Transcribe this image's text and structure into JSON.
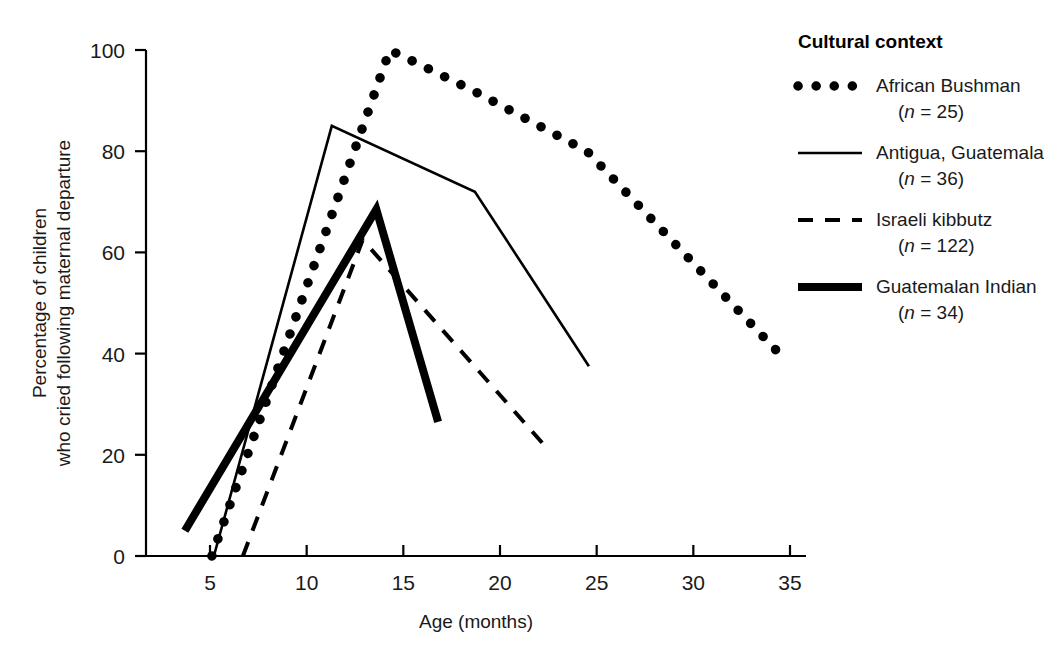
{
  "chart_data": {
    "type": "line",
    "title": "",
    "xlabel": "Age (months)",
    "ylabel": "Percentage of children who cried following maternal departure",
    "ylabel_line1": "Percentage of children",
    "ylabel_line2": "who cried following maternal departure",
    "xlim": [
      3,
      36
    ],
    "ylim": [
      0,
      100
    ],
    "xticks": [
      5,
      10,
      15,
      20,
      25,
      30,
      35
    ],
    "xtick_labels": [
      "5",
      "10",
      "15",
      "20",
      "25",
      "30",
      "35"
    ],
    "yticks": [
      0,
      20,
      40,
      60,
      80,
      100
    ],
    "ytick_labels": [
      "0",
      "20",
      "40",
      "60",
      "80",
      "100"
    ],
    "grid": false,
    "legend_position": "right",
    "legend_title": "Cultural context",
    "series": [
      {
        "name": "African Bushman",
        "n_label": "(n = 25)",
        "n": 25,
        "style": "dotted",
        "color": "#000000",
        "points": [
          {
            "x": 5.1,
            "y": 0
          },
          {
            "x": 14.3,
            "y": 100
          },
          {
            "x": 18.6,
            "y": 92
          },
          {
            "x": 24.5,
            "y": 80
          },
          {
            "x": 34.7,
            "y": 39
          }
        ]
      },
      {
        "name": "Antigua, Guatemala",
        "n_label": "(n = 36)",
        "n": 36,
        "style": "solid-thin",
        "color": "#000000",
        "points": [
          {
            "x": 5.2,
            "y": 0
          },
          {
            "x": 11.3,
            "y": 85
          },
          {
            "x": 18.7,
            "y": 72
          },
          {
            "x": 24.6,
            "y": 37.5
          }
        ]
      },
      {
        "name": "Israeli kibbutz",
        "n_label": "(n = 122)",
        "n": 122,
        "style": "dashed",
        "color": "#000000",
        "points": [
          {
            "x": 6.7,
            "y": 0
          },
          {
            "x": 12.9,
            "y": 62.5
          },
          {
            "x": 22.5,
            "y": 21
          }
        ]
      },
      {
        "name": "Guatemalan Indian",
        "n_label": "(n = 34)",
        "n": 34,
        "style": "solid-thick",
        "color": "#000000",
        "points": [
          {
            "x": 3.7,
            "y": 5
          },
          {
            "x": 13.6,
            "y": 68.5
          },
          {
            "x": 16.8,
            "y": 26.5
          }
        ]
      }
    ]
  }
}
